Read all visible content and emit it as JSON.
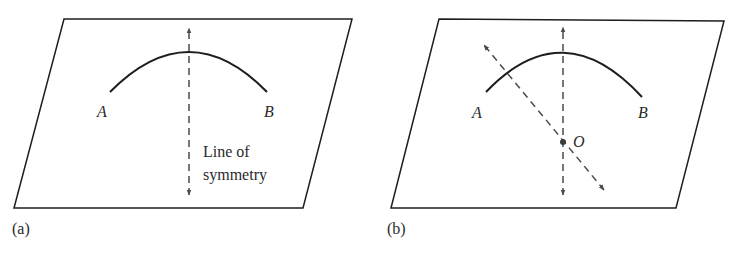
{
  "figure": {
    "panels": [
      {
        "id": "a",
        "caption": "(a)",
        "points": {
          "A": "A",
          "B": "B"
        },
        "annotation_line1": "Line of",
        "annotation_line2": "symmetry"
      },
      {
        "id": "b",
        "caption": "(b)",
        "points": {
          "A": "A",
          "B": "B",
          "O": "O"
        }
      }
    ],
    "colors": {
      "stroke": "#1e1e1e",
      "dashed": "#4a4a4a",
      "text": "#2a2a2a",
      "background": "#ffffff"
    }
  }
}
